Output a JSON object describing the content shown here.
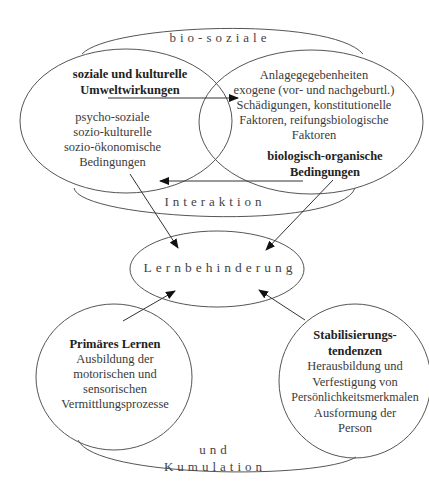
{
  "diagram": {
    "type": "concept-diagram",
    "connectors": {
      "top_arc": "bio-soziale",
      "middle_arc": "Interaktion",
      "bottom_arc_line1": "und",
      "bottom_arc_line2": "Kumulation"
    },
    "left_circle": {
      "title_line1": "soziale und kulturelle",
      "title_line2": "Umweltwirkungen",
      "lines": [
        "psycho-soziale",
        "sozio-kulturelle",
        "sozio-ökonomische",
        "Bedingungen"
      ]
    },
    "right_circle": {
      "lines": [
        "Anlagegegebenheiten",
        "exogene (vor- und nachgeburtl.)",
        "Schädigungen, konstitutionelle",
        "Faktoren, reifungsbiologische",
        "Faktoren"
      ],
      "title_line1": "biologisch-organische",
      "title_line2": "Bedingungen"
    },
    "center": {
      "label": "Lernbehinderung"
    },
    "bottom_left_circle": {
      "title": "Primäres Lernen",
      "lines": [
        "Ausbildung der",
        "motorischen und",
        "sensorischen",
        "Vermittlungsprozesse"
      ]
    },
    "bottom_right_circle": {
      "title_line1": "Stabilisierungs-",
      "title_line2": "tendenzen",
      "lines": [
        "Herausbildung und",
        "Verfestigung von",
        "Persönlichkeitsmerkmalen",
        "Ausformung der",
        "Person"
      ]
    },
    "colors": {
      "line": "#555555",
      "text": "#333333",
      "background": "#ffffff"
    }
  }
}
